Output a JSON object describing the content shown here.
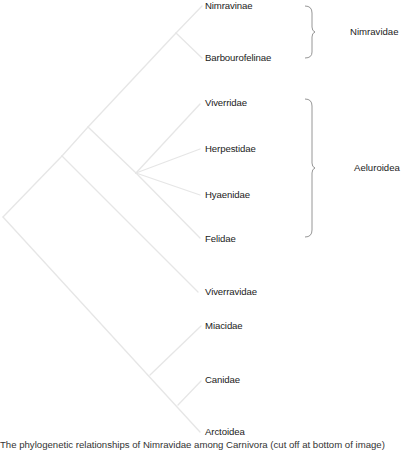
{
  "diagram": {
    "type": "cladogram",
    "colors": {
      "branch": "#e6e6e6",
      "brace": "#8a8a8a",
      "text": "#222222",
      "background": "#ffffff"
    },
    "taxa": [
      {
        "label": "Nimravinae"
      },
      {
        "label": "Barbourofelinae"
      },
      {
        "label": "Viverridae"
      },
      {
        "label": "Herpestidae"
      },
      {
        "label": "Hyaenidae"
      },
      {
        "label": "Felidae"
      },
      {
        "label": "Viverravidae"
      },
      {
        "label": "Miacidae"
      },
      {
        "label": "Canidae"
      },
      {
        "label": "Arctoidea"
      }
    ],
    "groups": [
      {
        "label": "Nimravidae",
        "members": [
          "Nimravinae",
          "Barbourofelinae"
        ]
      },
      {
        "label": "Aeluroidea",
        "members": [
          "Viverridae",
          "Herpestidae",
          "Hyaenidae",
          "Felidae"
        ]
      }
    ],
    "caption": "The phylogenetic relationships of Nimravidae among Carnivora (cut off at bottom of image)"
  }
}
